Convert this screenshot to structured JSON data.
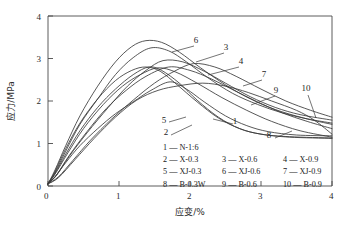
{
  "chart_data": {
    "type": "line",
    "title": "",
    "xlabel": "应变/%",
    "ylabel": "应力/MPa",
    "xlim": [
      0,
      4
    ],
    "ylim": [
      0,
      4
    ],
    "xticks": [
      "0",
      "1",
      "2",
      "3",
      "4"
    ],
    "yticks": [
      "0",
      "1",
      "2",
      "3",
      "4"
    ],
    "grid": false,
    "legend_position": "inside-lower-right",
    "series": [
      {
        "id": "1",
        "name": "N-1:6",
        "peak_strain": 1.72,
        "peak_stress": 2.45,
        "x": [
          0,
          0.1,
          0.25,
          0.45,
          0.7,
          0.95,
          1.2,
          1.45,
          1.72,
          1.95,
          2.2,
          2.5,
          2.8,
          3.1,
          3.5,
          4.0
        ],
        "y": [
          0.05,
          0.22,
          0.55,
          0.95,
          1.35,
          1.7,
          1.98,
          2.25,
          2.45,
          2.28,
          1.98,
          1.65,
          1.42,
          1.28,
          1.2,
          1.18
        ]
      },
      {
        "id": "2",
        "name": "X-0.3",
        "peak_strain": 1.42,
        "peak_stress": 2.8,
        "x": [
          0,
          0.1,
          0.25,
          0.45,
          0.7,
          0.95,
          1.2,
          1.42,
          1.6,
          1.85,
          2.1,
          2.4,
          2.7,
          3.0,
          3.4,
          4.0
        ],
        "y": [
          0.05,
          0.3,
          0.75,
          1.3,
          1.85,
          2.28,
          2.62,
          2.8,
          2.72,
          2.42,
          2.02,
          1.62,
          1.35,
          1.22,
          1.15,
          1.12
        ]
      },
      {
        "id": "3",
        "name": "X-0.6",
        "peak_strain": 1.45,
        "peak_stress": 3.25,
        "x": [
          0,
          0.1,
          0.25,
          0.45,
          0.7,
          0.95,
          1.2,
          1.45,
          1.7,
          1.95,
          2.25,
          2.6,
          2.95,
          3.3,
          3.65,
          4.0
        ],
        "y": [
          0.05,
          0.32,
          0.82,
          1.45,
          2.05,
          2.62,
          3.02,
          3.25,
          3.18,
          2.92,
          2.55,
          2.18,
          1.92,
          1.72,
          1.58,
          1.48
        ]
      },
      {
        "id": "4",
        "name": "X-0.9",
        "peak_strain": 1.62,
        "peak_stress": 2.95,
        "x": [
          0,
          0.12,
          0.3,
          0.55,
          0.85,
          1.12,
          1.38,
          1.62,
          1.9,
          2.2,
          2.5,
          2.85,
          3.2,
          3.55,
          4.0
        ],
        "y": [
          0.05,
          0.25,
          0.7,
          1.25,
          1.85,
          2.35,
          2.72,
          2.95,
          2.92,
          2.7,
          2.42,
          2.1,
          1.85,
          1.68,
          1.55
        ]
      },
      {
        "id": "5",
        "name": "XJ-0.3",
        "peak_strain": 1.38,
        "peak_stress": 2.8,
        "x": [
          0,
          0.1,
          0.25,
          0.45,
          0.7,
          0.95,
          1.18,
          1.38,
          1.58,
          1.82,
          2.1,
          2.4,
          2.7,
          3.0,
          3.4,
          4.0
        ],
        "y": [
          0.05,
          0.35,
          0.88,
          1.48,
          2.05,
          2.48,
          2.72,
          2.8,
          2.7,
          2.38,
          1.98,
          1.6,
          1.35,
          1.22,
          1.16,
          1.13
        ]
      },
      {
        "id": "6",
        "name": "XJ-0.6",
        "peak_strain": 1.38,
        "peak_stress": 3.42,
        "x": [
          0,
          0.1,
          0.25,
          0.45,
          0.7,
          0.95,
          1.18,
          1.38,
          1.6,
          1.85,
          2.15,
          2.5,
          2.85,
          3.2,
          3.6,
          4.0
        ],
        "y": [
          0.05,
          0.38,
          0.95,
          1.65,
          2.35,
          2.92,
          3.28,
          3.42,
          3.38,
          3.15,
          2.78,
          2.38,
          2.05,
          1.8,
          1.6,
          1.45
        ]
      },
      {
        "id": "7",
        "name": "XJ-0.9",
        "peak_strain": 2.05,
        "peak_stress": 2.88,
        "x": [
          0,
          0.15,
          0.35,
          0.6,
          0.9,
          1.2,
          1.5,
          1.78,
          2.05,
          2.35,
          2.65,
          3.0,
          3.35,
          3.7,
          4.0
        ],
        "y": [
          0.05,
          0.22,
          0.6,
          1.08,
          1.58,
          2.02,
          2.42,
          2.7,
          2.88,
          2.8,
          2.58,
          2.28,
          2.0,
          1.78,
          1.62
        ]
      },
      {
        "id": "8",
        "name": "B-0.3W",
        "peak_strain": 1.55,
        "peak_stress": 2.78,
        "x": [
          0,
          0.1,
          0.28,
          0.5,
          0.78,
          1.05,
          1.3,
          1.55,
          1.8,
          2.1,
          2.45,
          2.8,
          3.15,
          3.55,
          4.0
        ],
        "y": [
          0.05,
          0.28,
          0.78,
          1.35,
          1.92,
          2.35,
          2.62,
          2.78,
          2.68,
          2.42,
          2.08,
          1.78,
          1.52,
          1.3,
          1.15
        ]
      },
      {
        "id": "9",
        "name": "B-0.6",
        "peak_strain": 1.7,
        "peak_stress": 2.8,
        "x": [
          0,
          0.12,
          0.3,
          0.55,
          0.82,
          1.1,
          1.38,
          1.7,
          2.0,
          2.3,
          2.62,
          2.95,
          3.3,
          3.65,
          4.0
        ],
        "y": [
          0.05,
          0.26,
          0.72,
          1.28,
          1.82,
          2.25,
          2.58,
          2.8,
          2.72,
          2.52,
          2.25,
          1.98,
          1.72,
          1.52,
          1.35
        ]
      },
      {
        "id": "10",
        "name": "B-0.9",
        "peak_strain": 2.18,
        "peak_stress": 2.42,
        "x": [
          0,
          0.15,
          0.38,
          0.65,
          0.95,
          1.25,
          1.55,
          1.85,
          2.18,
          2.5,
          2.82,
          3.15,
          3.5,
          3.75,
          4.0
        ],
        "y": [
          0.05,
          0.2,
          0.62,
          1.12,
          1.62,
          2.02,
          2.25,
          2.36,
          2.42,
          2.35,
          2.2,
          2.0,
          1.78,
          1.55,
          1.22
        ]
      }
    ],
    "callouts": [
      {
        "label": "1",
        "x": 235,
        "y": 124
      },
      {
        "label": "2",
        "x": 166,
        "y": 135
      },
      {
        "label": "3",
        "x": 226,
        "y": 50
      },
      {
        "label": "4",
        "x": 241,
        "y": 64
      },
      {
        "label": "5",
        "x": 164,
        "y": 123
      },
      {
        "label": "6",
        "x": 196,
        "y": 43
      },
      {
        "label": "7",
        "x": 264,
        "y": 77
      },
      {
        "label": "8",
        "x": 269,
        "y": 138
      },
      {
        "label": "9",
        "x": 276,
        "y": 93
      },
      {
        "label": "10",
        "x": 306,
        "y": 91
      }
    ],
    "legend_rows": [
      [
        "1 — N-1:6"
      ],
      [
        "2 — X-0.3",
        "3 — X-0.6",
        "4 — X-0.9"
      ],
      [
        "5 — XJ-0.3",
        "6 — XJ-0.6",
        "7 — XJ-0.9"
      ],
      [
        "8 — B-0.3W",
        "9 — B-0.6",
        "10 — B-0.9"
      ]
    ]
  }
}
